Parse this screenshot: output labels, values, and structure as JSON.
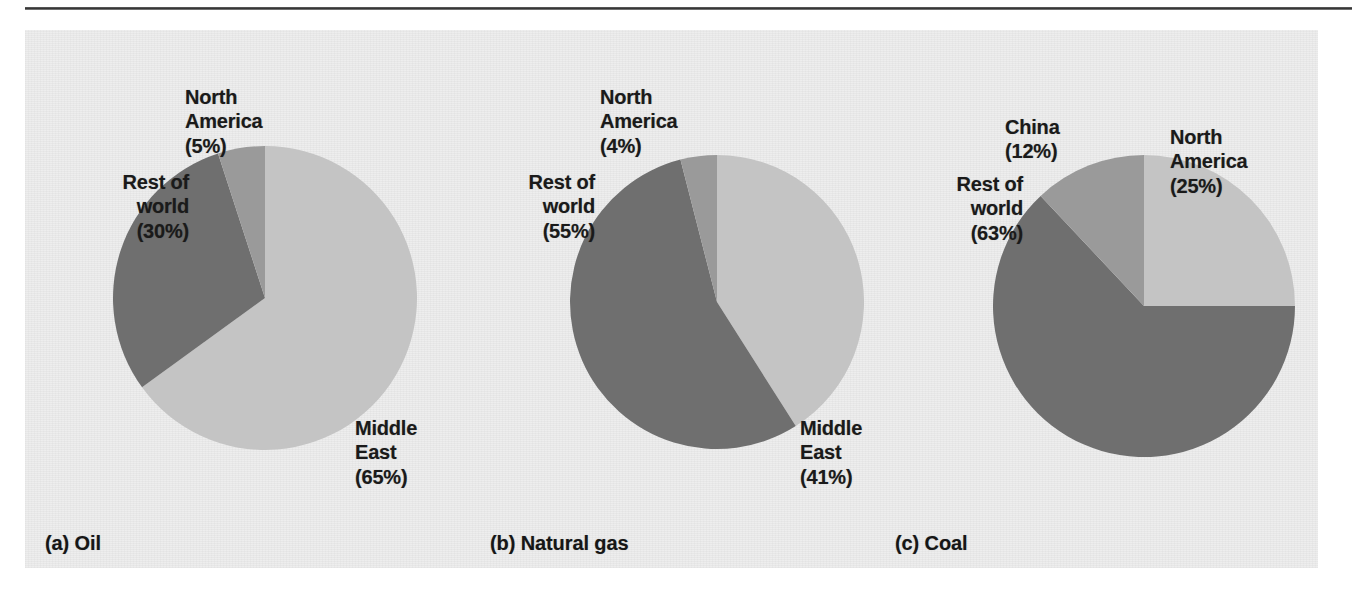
{
  "figure": {
    "background_color": "#ededed",
    "rule_color": "#2e2e2e"
  },
  "palette": {
    "light_gray": "#c4c4c4",
    "medium_gray": "#9a9a9a",
    "dark_gray": "#6f6f6f"
  },
  "charts": [
    {
      "id": "a",
      "caption": "(a) Oil",
      "labels": {
        "rest_of_world": "Rest of\nworld\n(30%)",
        "north_america": "North\nAmerica\n(5%)",
        "middle_east": "Middle\nEast\n(65%)"
      }
    },
    {
      "id": "b",
      "caption": "(b) Natural gas",
      "labels": {
        "rest_of_world": "Rest of\nworld\n(55%)",
        "north_america": "North\nAmerica\n(4%)",
        "middle_east": "Middle\nEast\n(41%)"
      }
    },
    {
      "id": "c",
      "caption": "(c) Coal",
      "labels": {
        "rest_of_world": "Rest of\nworld\n(63%)",
        "china": "China\n(12%)",
        "north_america": "North\nAmerica\n(25%)"
      }
    }
  ],
  "chart_data": [
    {
      "type": "pie",
      "title": "(a) Oil",
      "categories": [
        "Middle East",
        "Rest of world",
        "North America"
      ],
      "values": [
        65,
        30,
        5
      ],
      "units": "percent",
      "colors": [
        "#c4c4c4",
        "#6f6f6f",
        "#9a9a9a"
      ],
      "start_angle_deg": 0,
      "direction": "clockwise",
      "legend": "none",
      "labels_position": "outside-callout",
      "center_px": [
        264,
        297
      ],
      "radius_px": 151
    },
    {
      "type": "pie",
      "title": "(b) Natural gas",
      "categories": [
        "Middle East",
        "Rest of world",
        "North America"
      ],
      "values": [
        41,
        55,
        4
      ],
      "units": "percent",
      "colors": [
        "#c4c4c4",
        "#6f6f6f",
        "#9a9a9a"
      ],
      "start_angle_deg": 0,
      "direction": "clockwise",
      "legend": "none",
      "labels_position": "outside-callout",
      "center_px": [
        685,
        302
      ],
      "radius_px": 147
    },
    {
      "type": "pie",
      "title": "(c) Coal",
      "categories": [
        "North America",
        "Rest of world",
        "China"
      ],
      "values": [
        25,
        63,
        12
      ],
      "units": "percent",
      "colors": [
        "#c4c4c4",
        "#6f6f6f",
        "#9a9a9a"
      ],
      "start_angle_deg": 0,
      "direction": "clockwise",
      "legend": "none",
      "labels_position": "outside-callout",
      "center_px": [
        1118,
        307
      ],
      "radius_px": 151
    }
  ]
}
